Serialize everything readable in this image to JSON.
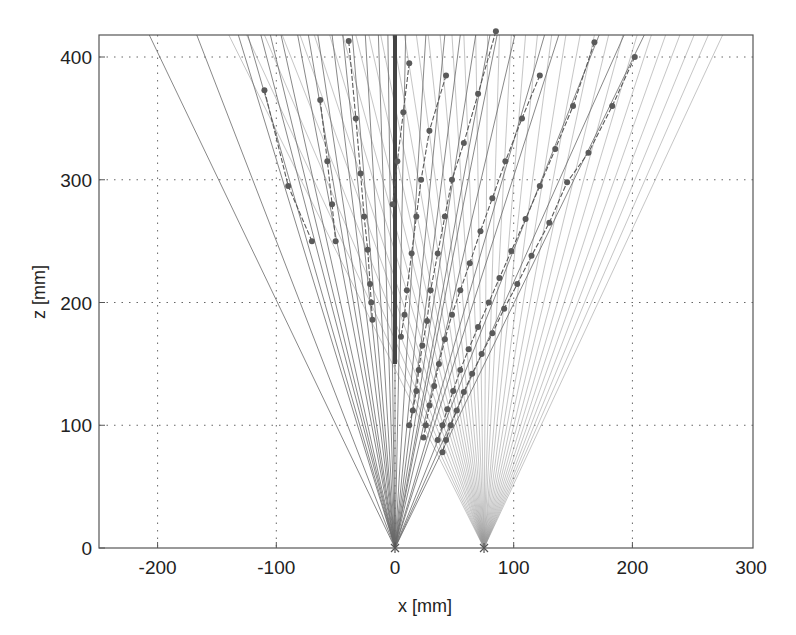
{
  "chart_data": {
    "type": "line",
    "title": "",
    "xlabel": "x [mm]",
    "ylabel": "z [mm]",
    "xlim": [
      -250,
      300
    ],
    "ylim": [
      0,
      418
    ],
    "xticks": [
      -200,
      -100,
      0,
      100,
      200,
      300
    ],
    "yticks": [
      0,
      100,
      200,
      300,
      400
    ],
    "xtick_labels": [
      "-200",
      "-100",
      "0",
      "100",
      "200",
      "300"
    ],
    "ytick_labels": [
      "0",
      "100",
      "200",
      "300",
      "400"
    ],
    "grid": true,
    "grid_style": "dotted",
    "colors": {
      "frame": "#555555",
      "grid": "#666666",
      "fan1_rays": "#6a6a6a",
      "fan2_rays": "#9a9a9a",
      "markers": "#5a5a5a",
      "vertical_bold": "#444444"
    },
    "sources": [
      {
        "name": "source-1",
        "x": 0,
        "z": 0
      },
      {
        "name": "source-2",
        "x": 75,
        "z": 0
      }
    ],
    "fan1_top_x": [
      -207,
      -167,
      -132,
      -124,
      -113,
      -105,
      -96,
      -82,
      -73,
      -65,
      -53,
      -44,
      -36,
      -25,
      -14,
      -6,
      0,
      9,
      26,
      42,
      55,
      68,
      80,
      86,
      101,
      126,
      138,
      172,
      193,
      210
    ],
    "fan1_top_x_left_only": [
      -207,
      -167,
      -132,
      -124,
      -113,
      -105,
      -96,
      -82,
      -73,
      -65,
      -53,
      -44,
      -36,
      -25,
      -14,
      -6
    ],
    "fan2_top_x": [
      -140,
      -125,
      -110,
      -95,
      -80,
      -68,
      -55,
      -44,
      -33,
      -22,
      -12,
      -2,
      8,
      18,
      28,
      38,
      48,
      58,
      68,
      78,
      88,
      98,
      110,
      120,
      132,
      144,
      156,
      168,
      180,
      192,
      204,
      216,
      228,
      240,
      252,
      264,
      276
    ],
    "fan2_top_z_limit": 418,
    "bold_vertical": {
      "x": 0,
      "z_from": 150,
      "z_to": 418
    },
    "marker_chains": [
      {
        "name": "chain-1",
        "points": [
          [
            -110,
            373
          ],
          [
            -90,
            295
          ],
          [
            -70,
            250
          ]
        ]
      },
      {
        "name": "chain-2",
        "points": [
          [
            -63,
            365
          ],
          [
            -57,
            315
          ],
          [
            -53,
            280
          ],
          [
            -50,
            250
          ]
        ]
      },
      {
        "name": "chain-3",
        "points": [
          [
            -39,
            413
          ],
          [
            -33,
            350
          ],
          [
            -29,
            305
          ],
          [
            -26,
            270
          ],
          [
            -23,
            243
          ],
          [
            -21,
            215
          ],
          [
            -20,
            200
          ],
          [
            -19,
            186
          ]
        ]
      },
      {
        "name": "chain-4",
        "points": [
          [
            12,
            395
          ],
          [
            7,
            355
          ],
          [
            2,
            315
          ],
          [
            -2,
            280
          ]
        ]
      },
      {
        "name": "chain-5",
        "points": [
          [
            43,
            385
          ],
          [
            29,
            340
          ],
          [
            22,
            300
          ],
          [
            18,
            270
          ],
          [
            14,
            240
          ],
          [
            10,
            210
          ],
          [
            8,
            190
          ],
          [
            5,
            172
          ]
        ]
      },
      {
        "name": "chain-6",
        "points": [
          [
            85,
            421
          ],
          [
            70,
            370
          ],
          [
            58,
            330
          ],
          [
            48,
            300
          ],
          [
            42,
            270
          ],
          [
            36,
            240
          ],
          [
            30,
            210
          ],
          [
            27,
            185
          ],
          [
            23,
            165
          ],
          [
            20,
            145
          ],
          [
            18,
            128
          ],
          [
            15,
            112
          ],
          [
            12,
            100
          ]
        ]
      },
      {
        "name": "chain-7",
        "points": [
          [
            122,
            385
          ],
          [
            107,
            350
          ],
          [
            93,
            315
          ],
          [
            82,
            285
          ],
          [
            72,
            258
          ],
          [
            63,
            232
          ],
          [
            55,
            210
          ],
          [
            48,
            190
          ],
          [
            42,
            170
          ],
          [
            37,
            150
          ],
          [
            33,
            132
          ],
          [
            29,
            116
          ],
          [
            26,
            100
          ],
          [
            24,
            90
          ]
        ]
      },
      {
        "name": "chain-8",
        "points": [
          [
            168,
            412
          ],
          [
            150,
            360
          ],
          [
            135,
            325
          ],
          [
            122,
            295
          ],
          [
            110,
            268
          ],
          [
            98,
            242
          ],
          [
            88,
            220
          ],
          [
            79,
            200
          ],
          [
            70,
            180
          ],
          [
            62,
            162
          ],
          [
            55,
            145
          ],
          [
            49,
            128
          ],
          [
            44,
            113
          ],
          [
            40,
            100
          ],
          [
            36,
            88
          ]
        ]
      },
      {
        "name": "chain-9",
        "points": [
          [
            202,
            400
          ],
          [
            183,
            360
          ],
          [
            163,
            322
          ],
          [
            145,
            298
          ],
          [
            130,
            265
          ],
          [
            115,
            238
          ],
          [
            103,
            215
          ],
          [
            92,
            195
          ],
          [
            82,
            175
          ],
          [
            73,
            158
          ],
          [
            65,
            142
          ],
          [
            58,
            127
          ],
          [
            52,
            112
          ],
          [
            47,
            100
          ],
          [
            43,
            88
          ],
          [
            40,
            78
          ]
        ]
      }
    ]
  },
  "axes": {
    "x_label": "x [mm]",
    "y_label": "z [mm]"
  }
}
